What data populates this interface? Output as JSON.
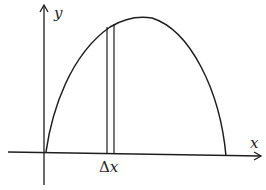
{
  "diagram": {
    "type": "riemann-strip-under-curve",
    "labels": {
      "y_axis": "y",
      "x_axis": "x",
      "strip_width_delta": "Δ",
      "strip_width_var": "x"
    },
    "colors": {
      "ink": "#1e1e1e",
      "background": "#ffffff"
    }
  }
}
